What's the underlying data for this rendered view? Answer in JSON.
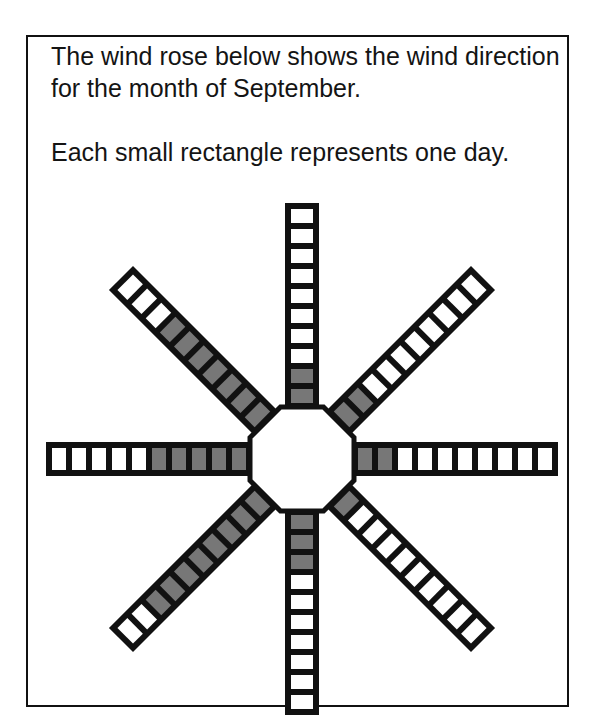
{
  "intro": {
    "paragraph_1": "The wind rose below shows the wind direction for the month of September.",
    "paragraph_2": "Each small rectangle represents one day."
  },
  "colors": {
    "outline": "#111111",
    "shaded": "#777777",
    "unshaded": "#ffffff"
  },
  "chart_data": {
    "type": "wind-rose",
    "unit": "days",
    "rectangles_per_arm": 10,
    "directions": [
      "N",
      "NE",
      "E",
      "SE",
      "S",
      "SW",
      "W",
      "NW"
    ],
    "shaded_days": [
      2,
      2,
      2,
      1,
      3,
      8,
      5,
      7
    ],
    "total_shaded_days": 30
  }
}
